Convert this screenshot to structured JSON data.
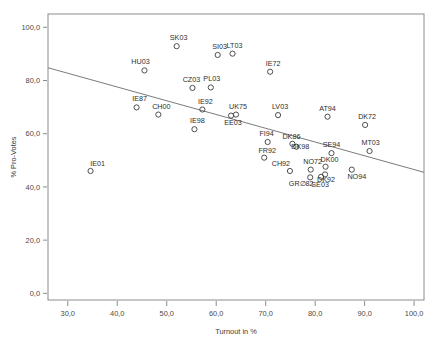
{
  "chart_data": {
    "type": "scatter",
    "title": "",
    "xlabel": "Turnout in %",
    "ylabel": "% Pro-Votes",
    "xlim": [
      26.0,
      102.0
    ],
    "ylim": [
      -2.5,
      105.0
    ],
    "xticks": [
      30.0,
      40.0,
      50.0,
      60.0,
      70.0,
      80.0,
      90.0,
      100.0
    ],
    "yticks": [
      0.0,
      20.0,
      40.0,
      60.0,
      80.0,
      100.0
    ],
    "xtick_labels": [
      "30,0",
      "40,0",
      "50,0",
      "60,0",
      "70,0",
      "80,0",
      "90,0",
      "100,0"
    ],
    "ytick_labels": [
      "0,0",
      "20,0",
      "40,0",
      "60,0",
      "80,0",
      "100,0"
    ],
    "grid": false,
    "legend": "none",
    "decimal_separator": ",",
    "marker_style": "open-circle",
    "fit_line": {
      "visible": true,
      "x_start": 26.0,
      "y_start": 84.8,
      "x_end": 102.0,
      "y_end": 45.5
    },
    "points": [
      {
        "label": "IE01",
        "x": 34.6,
        "y": 46.0,
        "lx": 7,
        "ly": -5
      },
      {
        "label": "HU03",
        "x": 45.5,
        "y": 83.8,
        "lx": -4,
        "ly": -6
      },
      {
        "label": "IE87",
        "x": 43.9,
        "y": 69.9,
        "lx": 3,
        "ly": -6
      },
      {
        "label": "CH00",
        "x": 48.3,
        "y": 67.2,
        "lx": 3,
        "ly": -6
      },
      {
        "label": "SK03",
        "x": 52.0,
        "y": 92.9,
        "lx": 2,
        "ly": -6
      },
      {
        "label": "CZ03",
        "x": 55.2,
        "y": 77.2,
        "lx": -1,
        "ly": -6
      },
      {
        "label": "IE98",
        "x": 55.6,
        "y": 61.7,
        "lx": 3,
        "ly": -6
      },
      {
        "label": "IE92",
        "x": 57.2,
        "y": 69.1,
        "lx": 3,
        "ly": -6
      },
      {
        "label": "PL03",
        "x": 58.9,
        "y": 77.4,
        "lx": 1,
        "ly": -6
      },
      {
        "label": "SI03",
        "x": 60.3,
        "y": 89.6,
        "lx": 2,
        "ly": -6
      },
      {
        "label": "LT03",
        "x": 63.3,
        "y": 90.1,
        "lx": 2,
        "ly": -6
      },
      {
        "label": "EE03",
        "x": 63.0,
        "y": 66.8,
        "lx": 2,
        "ly": 9
      },
      {
        "label": "UK75",
        "x": 64.0,
        "y": 67.2,
        "lx": 2,
        "ly": -6
      },
      {
        "label": "IE72",
        "x": 70.9,
        "y": 83.3,
        "lx": 3,
        "ly": -6
      },
      {
        "label": "FI94",
        "x": 70.4,
        "y": 56.9,
        "lx": -1,
        "ly": -6
      },
      {
        "label": "FR92",
        "x": 69.7,
        "y": 51.0,
        "lx": 3,
        "ly": -5
      },
      {
        "label": "LV03",
        "x": 72.5,
        "y": 67.0,
        "lx": 2,
        "ly": -6
      },
      {
        "label": "DK86",
        "x": 75.4,
        "y": 56.2,
        "lx": -1,
        "ly": -5
      },
      {
        "label": "DK98",
        "x": 76.2,
        "y": 55.1,
        "lx": 4,
        "ly": 2
      },
      {
        "label": "CH92",
        "x": 74.9,
        "y": 46.0,
        "lx": -9,
        "ly": -5
      },
      {
        "label": "GR∅82",
        "x": 79.0,
        "y": 43.6,
        "lx": -9,
        "ly": 9
      },
      {
        "label": "NO72",
        "x": 79.1,
        "y": 46.5,
        "lx": 2,
        "ly": -6
      },
      {
        "label": "SE03",
        "x": 81.2,
        "y": 43.8,
        "lx": -1,
        "ly": 10
      },
      {
        "label": "DK00",
        "x": 82.1,
        "y": 47.6,
        "lx": 4,
        "ly": -5
      },
      {
        "label": "DK92",
        "x": 82.0,
        "y": 44.7,
        "lx": 1,
        "ly": 8
      },
      {
        "label": "SE94",
        "x": 83.3,
        "y": 52.7,
        "lx": 0,
        "ly": -6
      },
      {
        "label": "AT94",
        "x": 82.5,
        "y": 66.4,
        "lx": 0,
        "ly": -6
      },
      {
        "label": "NO94",
        "x": 87.4,
        "y": 46.5,
        "lx": 5,
        "ly": 9
      },
      {
        "label": "DK72",
        "x": 90.1,
        "y": 63.3,
        "lx": 2,
        "ly": -6
      },
      {
        "label": "MT03",
        "x": 91.0,
        "y": 53.5,
        "lx": 1,
        "ly": -6
      }
    ]
  },
  "geometry": {
    "plot_left": 48,
    "plot_right": 424,
    "plot_top": 14,
    "plot_bottom": 300,
    "marker_radius": 2.6
  }
}
